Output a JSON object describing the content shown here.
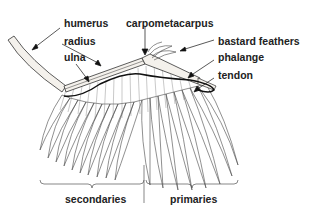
{
  "diagram": {
    "labels": {
      "humerus": "humerus",
      "radius": "radius",
      "ulna": "ulna",
      "carpometacarpus": "carpometacarpus",
      "bastard_feathers": "bastard feathers",
      "phalange": "phalange",
      "tendon": "tendon",
      "secondaries": "secondaries",
      "primaries": "primaries"
    }
  }
}
